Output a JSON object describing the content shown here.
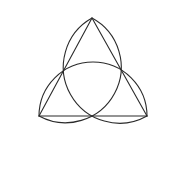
{
  "diagram": {
    "background": "#ffffff",
    "stroke_color": "#2b2b2b",
    "stroke_width": 1.1,
    "triangle": {
      "vertices": [
        {
          "name": "top",
          "x": 92,
          "y": 18
        },
        {
          "name": "bottom-left",
          "x": 39,
          "y": 116
        },
        {
          "name": "bottom-right",
          "x": 147,
          "y": 116
        }
      ]
    },
    "semicircles": [
      {
        "side": "left",
        "from": "top",
        "to": "bottom-left"
      },
      {
        "side": "right",
        "from": "bottom-right",
        "to": "top"
      },
      {
        "side": "bottom",
        "from": "bottom-left",
        "to": "bottom-right"
      }
    ]
  }
}
